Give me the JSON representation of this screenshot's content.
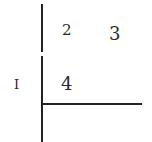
{
  "diagram": {
    "left_label": "I",
    "cells": [
      {
        "id": "cell-2",
        "label": "2"
      },
      {
        "id": "cell-3",
        "label": "3"
      },
      {
        "id": "cell-4",
        "label": "4"
      }
    ],
    "line_color": "#222222",
    "text_color": "#2a2a2a",
    "background": "#ffffff"
  }
}
